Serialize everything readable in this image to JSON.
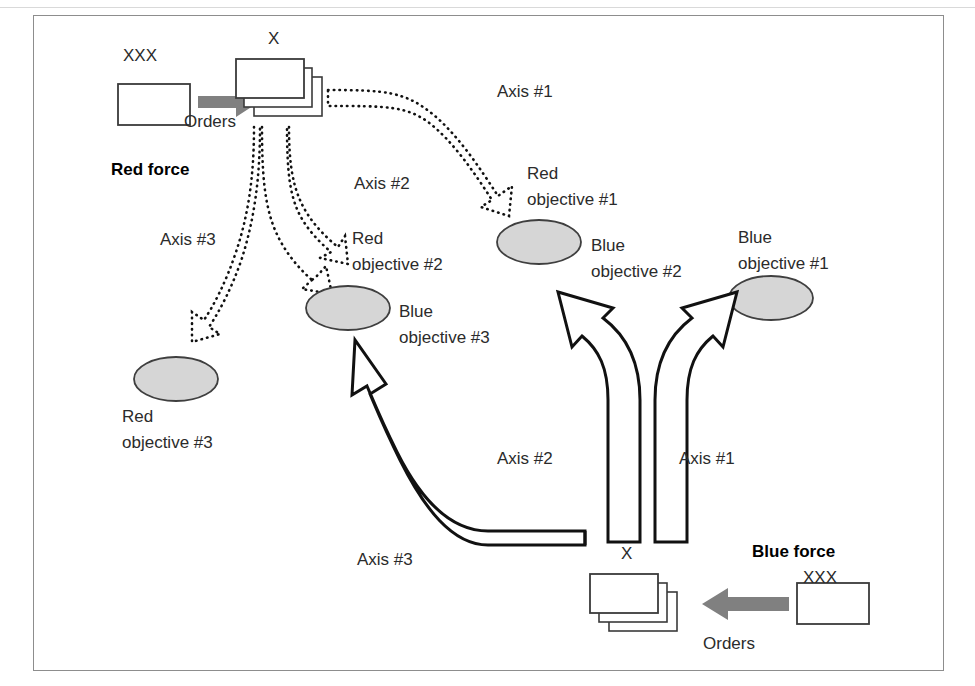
{
  "figure": {
    "frame": {
      "stroke": "#8d8d8d"
    },
    "colors": {
      "ellipse_fill": "#d6d6d6",
      "ellipse_stroke": "#3f3f3f",
      "orders_arrow": "#808080",
      "dotted_arrow": "#111111",
      "solid_arrow": "#111111",
      "unit_box_stroke": "#3a3a3a",
      "text": "#2b2b2b"
    }
  },
  "red_force": {
    "force_label": "Red force",
    "hq_echelon": "XXX",
    "orders_label": "Orders",
    "unit_echelon": "X",
    "axes": [
      {
        "name": "Axis #1"
      },
      {
        "name": "Axis #2"
      },
      {
        "name": "Axis #3"
      }
    ],
    "objectives": [
      {
        "line1": "Red",
        "line2": "objective #1"
      },
      {
        "line1": "Red",
        "line2": "objective #2"
      },
      {
        "line1": "Red",
        "line2": "objective #3"
      }
    ]
  },
  "blue_force": {
    "force_label": "Blue force",
    "hq_echelon": "XXX",
    "orders_label": "Orders",
    "unit_echelon": "X",
    "axes": [
      {
        "name": "Axis #1"
      },
      {
        "name": "Axis #2"
      },
      {
        "name": "Axis #3"
      }
    ],
    "objectives": [
      {
        "line1": "Blue",
        "line2": "objective #1"
      },
      {
        "line1": "Blue",
        "line2": "objective #2"
      },
      {
        "line1": "Blue",
        "line2": "objective #3"
      }
    ]
  },
  "icons": {
    "orders_arrow_right": "arrow-right-icon",
    "orders_arrow_left": "arrow-left-icon",
    "dotted_axis_arrow": "dotted-axis-arrow-icon",
    "solid_axis_arrow": "solid-axis-arrow-icon",
    "objective_ellipse": "objective-ellipse-icon",
    "unit_stack": "unit-stack-icon",
    "hq_box": "hq-box-icon"
  }
}
